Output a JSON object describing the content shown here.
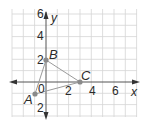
{
  "diagram": {
    "type": "coordinate-plane",
    "x_axis_label": "x",
    "y_axis_label": "y",
    "origin_label": "0",
    "x_ticks": [
      {
        "value": 2,
        "label": "2"
      },
      {
        "value": 4,
        "label": "4"
      },
      {
        "value": 6,
        "label": "6"
      }
    ],
    "y_ticks": [
      {
        "value": 6,
        "label": "6"
      },
      {
        "value": 4,
        "label": "4"
      },
      {
        "value": 2,
        "label": "2"
      },
      {
        "value": -2,
        "label": "2"
      }
    ],
    "points": [
      {
        "name": "A",
        "x": -1,
        "y": -1
      },
      {
        "name": "B",
        "x": 0,
        "y": 2
      },
      {
        "name": "C",
        "x": 3,
        "y": 0
      }
    ],
    "segments": [
      [
        "A",
        "B"
      ],
      [
        "B",
        "C"
      ],
      [
        "C",
        "A"
      ]
    ],
    "colors": {
      "grid": "#cfcfcf",
      "axis": "#555555",
      "triangle": "#9a9a9a",
      "point": "#8a8a8a"
    }
  }
}
